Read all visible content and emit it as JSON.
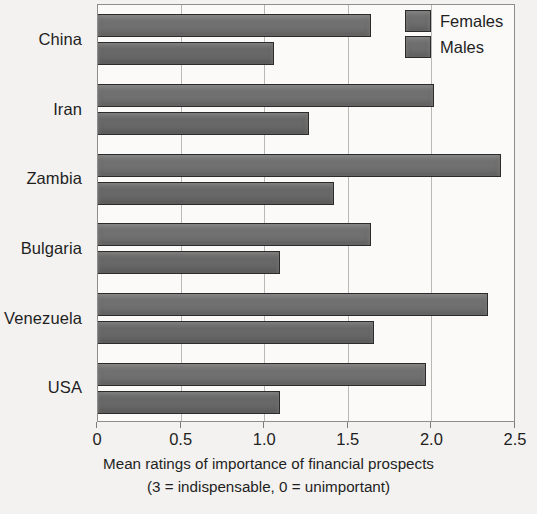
{
  "chart_data": {
    "type": "bar",
    "orientation": "horizontal",
    "title": "",
    "xlabel": "Mean ratings of importance of financial prospects (3 = indispensable, 0 = unimportant)",
    "ylabel": "",
    "categories": [
      "China",
      "Iran",
      "Zambia",
      "Bulgaria",
      "Venezuela",
      "USA"
    ],
    "series": [
      {
        "name": "Females",
        "values": [
          1.63,
          2.01,
          2.41,
          1.63,
          2.33,
          1.96
        ]
      },
      {
        "name": "Males",
        "values": [
          1.05,
          1.26,
          1.41,
          1.09,
          1.65,
          1.09
        ]
      }
    ],
    "xlim": [
      0,
      2.5
    ],
    "xticks": [
      0,
      0.5,
      1.0,
      1.5,
      2.0,
      2.5
    ],
    "xtick_labels": [
      "0",
      "0.5",
      "1.0",
      "1.5",
      "2.0",
      "2.5"
    ],
    "grid": true,
    "grid_axis": "x",
    "legend_position": "top-right"
  },
  "axis": {
    "title_line1": "Mean ratings of importance of financial prospects",
    "title_line2": "(3 = indispensable, 0 = unimportant)"
  },
  "legend": {
    "entries": [
      {
        "label": "Females",
        "color": "#707070"
      },
      {
        "label": "Males",
        "color": "#686868"
      }
    ]
  },
  "colors": {
    "female_bar": "#707070",
    "male_bar": "#686868",
    "bar_outline": "#2b2b2b",
    "plot_background": "#fbfaf9",
    "page_background": "#f3f2f0",
    "grid": "#b9b8b5",
    "text": "#1f1f1f"
  }
}
